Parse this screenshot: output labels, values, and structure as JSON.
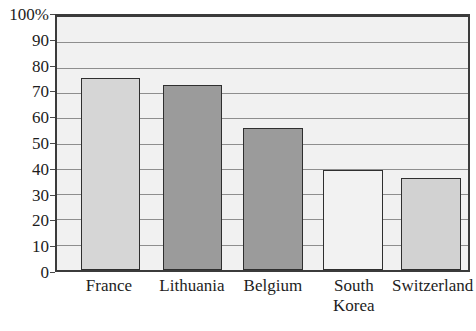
{
  "chart_data": {
    "type": "bar",
    "title": "",
    "xlabel": "",
    "ylabel": "",
    "ylim": [
      0,
      100
    ],
    "grid": true,
    "legend": null,
    "categories": [
      "France",
      "Lithuania",
      "Belgium",
      "South\nKorea",
      "Switzerland"
    ],
    "values": [
      76,
      73,
      56,
      39.5,
      36.5
    ],
    "ytick_labels": [
      "100%",
      "90",
      "80",
      "70",
      "60",
      "50",
      "40",
      "30",
      "20",
      "10",
      "0"
    ],
    "ytick_values": [
      100,
      90,
      80,
      70,
      60,
      50,
      40,
      30,
      20,
      10,
      0
    ],
    "bar_colors": [
      "#d6d6d6",
      "#9b9b9b",
      "#9b9b9b",
      "#f2f2f2",
      "#d2d2d2"
    ],
    "bar_edge_color": "#2f2f2f",
    "plot_background": "#f1f1f1",
    "gridline_color": "#8e8e8e",
    "axis_color": "#3b3b3b",
    "bars": [
      {
        "label": "France",
        "value": 76,
        "color": "#d6d6d6",
        "center_pct": 13.0,
        "width_pct": 14.5
      },
      {
        "label": "Lithuania",
        "value": 73,
        "color": "#9b9b9b",
        "center_pct": 33.0,
        "width_pct": 14.5
      },
      {
        "label": "Belgium",
        "value": 56,
        "color": "#9b9b9b",
        "center_pct": 52.5,
        "width_pct": 14.5
      },
      {
        "label": "South Korea",
        "value": 39.5,
        "color": "#f2f2f2",
        "center_pct": 72.0,
        "width_pct": 14.5
      },
      {
        "label": "Switzerland",
        "value": 36.5,
        "color": "#d2d2d2",
        "center_pct": 91.0,
        "width_pct": 14.5
      }
    ]
  }
}
